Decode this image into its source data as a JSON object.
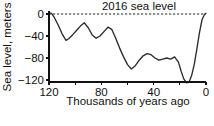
{
  "chart_data": {
    "type": "line",
    "title": "",
    "xlabel": "Thousands of years ago",
    "ylabel": "Sea level, meters",
    "xlim": [
      120,
      0
    ],
    "ylim": [
      -135,
      10
    ],
    "x_ticks": [
      120,
      100,
      80,
      60,
      40,
      20,
      0
    ],
    "x_tick_labels": [
      "120",
      "",
      "80",
      "",
      "40",
      "",
      "0"
    ],
    "y_ticks": [
      0,
      -40,
      -80,
      -120
    ],
    "y_tick_labels": [
      "0",
      "−40",
      "−80",
      "−120"
    ],
    "grid": false,
    "legend": "none",
    "x_axis_reversed": true,
    "annotations": [
      {
        "name": "2016-sea-level-line",
        "text": "2016 sea level",
        "value": 0,
        "style": "dashed-horizontal-line"
      }
    ],
    "series": [
      {
        "name": "Sea level",
        "units": "meters",
        "x": [
          120,
          118,
          116,
          113,
          110,
          107,
          105,
          102,
          99,
          96,
          93,
          90,
          87,
          84,
          81,
          78,
          75,
          72,
          69,
          66,
          63,
          60,
          57,
          54,
          51,
          48,
          45,
          42,
          39,
          36,
          33,
          30,
          27,
          24,
          21,
          19,
          17,
          15,
          13,
          11,
          9,
          7,
          5,
          3,
          1,
          0
        ],
        "y": [
          2,
          1,
          -6,
          -20,
          -36,
          -48,
          -45,
          -38,
          -30,
          -22,
          -16,
          -25,
          -38,
          -44,
          -40,
          -32,
          -24,
          -28,
          -44,
          -62,
          -78,
          -92,
          -100,
          -94,
          -84,
          -76,
          -72,
          -74,
          -80,
          -84,
          -82,
          -80,
          -82,
          -78,
          -88,
          -104,
          -118,
          -125,
          -124,
          -112,
          -92,
          -64,
          -34,
          -10,
          0,
          1
        ]
      }
    ]
  },
  "axis_labels": {
    "y_title": "Sea level, meters",
    "x_title": "Thousands of years ago"
  },
  "colors": {
    "line": "#2b2b2b",
    "axis": "#111111",
    "background": "#ffffff",
    "zero_line": "#222222"
  }
}
